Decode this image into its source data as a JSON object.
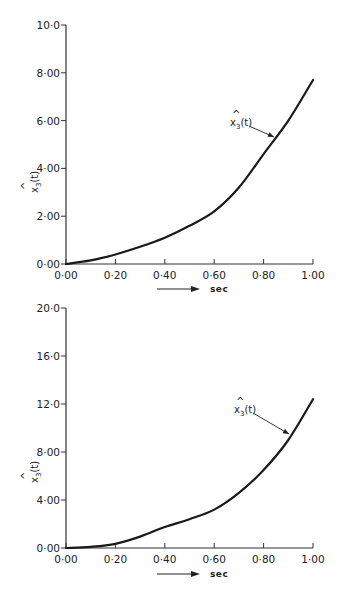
{
  "chart_data": [
    {
      "type": "line",
      "title": "",
      "xlabel": "sec",
      "ylabel": "x̂3(t)",
      "xlim": [
        0,
        1.0
      ],
      "ylim": [
        0,
        10.0
      ],
      "grid": false,
      "x_ticks": [
        "0·00",
        "0·20",
        "0·40",
        "0·60",
        "0·80",
        "1·00"
      ],
      "y_ticks": [
        "0·00",
        "2·00",
        "4·00",
        "6·00",
        "8·00",
        "10·0"
      ],
      "annotation": "x̂3(t)",
      "series": [
        {
          "name": "x̂3(t)",
          "x": [
            0.0,
            0.1,
            0.2,
            0.3,
            0.4,
            0.5,
            0.6,
            0.7,
            0.8,
            0.9,
            1.0
          ],
          "values": [
            0.0,
            0.15,
            0.4,
            0.72,
            1.1,
            1.6,
            2.2,
            3.2,
            4.6,
            6.0,
            7.7
          ]
        }
      ]
    },
    {
      "type": "line",
      "title": "",
      "xlabel": "sec",
      "ylabel": "x̂3(t)",
      "xlim": [
        0,
        1.0
      ],
      "ylim": [
        0,
        20.0
      ],
      "grid": false,
      "x_ticks": [
        "0·00",
        "0·20",
        "0·40",
        "0·60",
        "0·80",
        "1·00"
      ],
      "y_ticks": [
        "0·00",
        "4·00",
        "8·00",
        "12·0",
        "16·0",
        "20·0"
      ],
      "annotation": "x̂3(t)",
      "series": [
        {
          "name": "x̂3(t)",
          "x": [
            0.0,
            0.1,
            0.2,
            0.3,
            0.4,
            0.5,
            0.6,
            0.7,
            0.8,
            0.9,
            1.0
          ],
          "values": [
            0.0,
            0.1,
            0.35,
            0.95,
            1.75,
            2.4,
            3.2,
            4.6,
            6.5,
            9.0,
            12.4
          ]
        }
      ]
    }
  ],
  "charts": [
    {
      "y_label_main": "x",
      "y_label_sub": "3",
      "y_label_tail": "(t)",
      "y_label_hat": "^",
      "x_unit": "sec",
      "ann_main": "x",
      "ann_sub": "3",
      "ann_tail": "(t)",
      "ann_hat": "^"
    },
    {
      "y_label_main": "x",
      "y_label_sub": "3",
      "y_label_tail": "(t)",
      "y_label_hat": "^",
      "x_unit": "sec",
      "ann_main": "x",
      "ann_sub": "3",
      "ann_tail": "(t)",
      "ann_hat": "^"
    }
  ]
}
